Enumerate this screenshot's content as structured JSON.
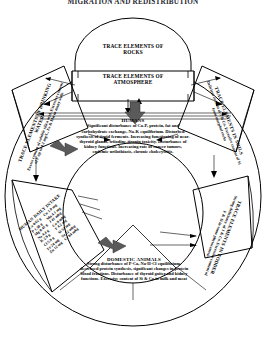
{
  "header": {
    "title": "MIGRATION AND REDISTRIBUTION"
  },
  "nodes": {
    "rocks": {
      "title": "TRACE ELEMENTS OF ROCKS",
      "line1": "TRACE ELEMENTS OF",
      "line2": "ROCKS"
    },
    "atmosphere": {
      "title": "TRACE ELEMENTS OF ATMOSPHERE",
      "line1": "TRACE ELEMENTS OF",
      "line2": "ATMOSPHERE"
    },
    "water": {
      "title": "TRACE ELEMENTS IN DRINKING WATER",
      "body": "Excess content of soluble silica acid. Excessive content of F up to 4.1 mg/L, Fe & Mn in many wells"
    },
    "soils": {
      "title": "TRACE ELEMENTS IN SOILS",
      "body": "Deficient content of J & Co. Excessive content of Si from morphol rocks"
    },
    "fodder": {
      "title": "TRACE ELEMENTS IN FODDER",
      "body": "Strong deficiency of J & Co. Excessive content of F & Si in some phytocenosis"
    },
    "humans": {
      "title": "HUMANS",
      "body": "Significant disturbance of Ca-P, protein, fat and carbohydrate exchange, Na-K equilibrium. Disturbed synthesis of tiroid ferments. Increasing functioning of near-thyroid glands, triiodine-tironin toxicity. Disturbance of kidney functions. Increasing rate of cancer tumors, endemic urilothiasis, chronic cholecystitis."
    },
    "animals": {
      "title": "DOMESTIC ANIMALS",
      "body": "Strong disturbance of P-Ca, Na-H-Cl equilibrium, decreased protein synthesis, significant changes in protein blood fractions. Disturbance of thyroid goiter and kidney functions. Excessive content of Si & Ca in milk and meat"
    }
  },
  "intake": {
    "title": "HUMAN DAILY INTAKE",
    "columns": [
      [
        "Ca 0.62 g",
        "P 1.38 g",
        "Mg 0.41 g",
        "Na 4.4 g",
        "K 2.9 g",
        "Cl 5.9 g",
        "Fe 24 mg",
        "Zn 12 mg"
      ],
      [
        "Cu 1.9 mg",
        "Mn 4.1 mg",
        "J 41 mkg",
        "Co 9 mkg",
        "F 4.2 mg",
        "Si 51 mg",
        "Se 22 mkg",
        "Cr 84 mkg"
      ]
    ]
  },
  "colors": {
    "stroke": "#000000",
    "arrow_fill": "#5a5a5a",
    "background": "#ffffff",
    "header_text": "#2b2b35"
  }
}
